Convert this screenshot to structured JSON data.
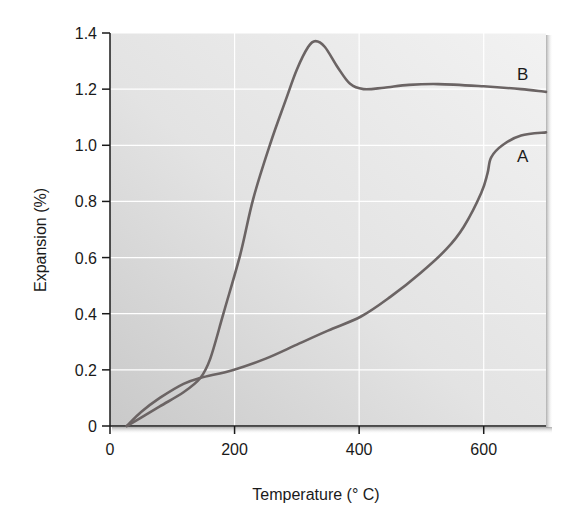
{
  "chart_data": {
    "type": "line",
    "title": "",
    "xlabel": "Temperature (° C)",
    "ylabel": "Expansion (%)",
    "xlim": [
      0,
      700
    ],
    "ylim": [
      0,
      1.4
    ],
    "xticks": [
      0,
      200,
      400,
      600
    ],
    "xtick_labels": [
      "0",
      "200",
      "400",
      "600"
    ],
    "yticks": [
      0,
      0.2,
      0.4,
      0.6,
      0.8,
      1.0,
      1.2,
      1.4
    ],
    "ytick_labels": [
      "0",
      "0.2",
      "0.4",
      "0.6",
      "0.8",
      "1.0",
      "1.2",
      "1.4"
    ],
    "grid": true,
    "legend": "inline labels at right end of each curve",
    "series": [
      {
        "name": "A",
        "x": [
          27,
          50,
          80,
          118,
          145,
          198,
          250,
          300,
          350,
          403,
          450,
          499,
          540,
          568,
          596,
          606,
          612,
          630,
          660,
          700
        ],
        "y": [
          0,
          0.05,
          0.1,
          0.15,
          0.171,
          0.2,
          0.24,
          0.29,
          0.34,
          0.39,
          0.46,
          0.546,
          0.63,
          0.71,
          0.83,
          0.9,
          0.957,
          1.0,
          1.035,
          1.046
        ]
      },
      {
        "name": "B",
        "x": [
          27,
          50,
          80,
          118,
          145,
          161,
          182,
          209,
          230,
          258,
          282,
          300,
          318,
          330,
          345,
          365,
          385,
          407,
          440,
          480,
          527,
          600,
          660,
          700
        ],
        "y": [
          0,
          0.03,
          0.07,
          0.12,
          0.171,
          0.24,
          0.4,
          0.61,
          0.81,
          1.01,
          1.16,
          1.27,
          1.35,
          1.371,
          1.35,
          1.28,
          1.22,
          1.2,
          1.205,
          1.215,
          1.218,
          1.21,
          1.2,
          1.19
        ]
      }
    ],
    "annotations": [
      {
        "text": "B",
        "series": "B"
      },
      {
        "text": "A",
        "series": "A"
      }
    ]
  },
  "colors": {
    "line": "#6b6464",
    "axis": "#1a1a1a",
    "grid": "#ffffff",
    "plot_bg_dark": "#c9c9c9",
    "plot_bg_light": "#f2f2f2"
  }
}
